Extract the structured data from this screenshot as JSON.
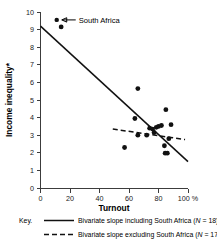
{
  "chart_data": {
    "type": "scatter",
    "title": "",
    "xlabel": "Turnout",
    "ylabel": "Income inequality*",
    "xlim": [
      0,
      100
    ],
    "ylim": [
      0,
      10
    ],
    "xticks": [
      0,
      20,
      40,
      60,
      80,
      100
    ],
    "xtick_labels": [
      "0",
      "20",
      "40",
      "60",
      "80",
      "100 %"
    ],
    "yticks": [
      0,
      1,
      2,
      3,
      4,
      5,
      6,
      7,
      8,
      9,
      10
    ],
    "ytick_labels": [
      "0",
      "1",
      "2",
      "3",
      "4",
      "5",
      "6",
      "7",
      "8",
      "9",
      "10"
    ],
    "grid": false,
    "x_unit_suffix": "%",
    "points": [
      {
        "x": 14.0,
        "y": 9.15,
        "label": "South Africa"
      },
      {
        "x": 66.0,
        "y": 5.65,
        "label": ""
      },
      {
        "x": 64.0,
        "y": 3.95,
        "label": ""
      },
      {
        "x": 66.0,
        "y": 3.0,
        "label": ""
      },
      {
        "x": 57.0,
        "y": 2.3,
        "label": ""
      },
      {
        "x": 72.0,
        "y": 3.0,
        "label": ""
      },
      {
        "x": 74.0,
        "y": 3.4,
        "label": ""
      },
      {
        "x": 76.0,
        "y": 3.35,
        "label": ""
      },
      {
        "x": 77.0,
        "y": 3.15,
        "label": ""
      },
      {
        "x": 78.5,
        "y": 3.45,
        "label": ""
      },
      {
        "x": 80.0,
        "y": 3.5,
        "label": ""
      },
      {
        "x": 82.0,
        "y": 3.55,
        "label": ""
      },
      {
        "x": 85.0,
        "y": 4.45,
        "label": ""
      },
      {
        "x": 84.0,
        "y": 2.4,
        "label": ""
      },
      {
        "x": 84.5,
        "y": 1.98,
        "label": ""
      },
      {
        "x": 86.0,
        "y": 1.98,
        "label": ""
      },
      {
        "x": 88.5,
        "y": 3.6,
        "label": ""
      },
      {
        "x": 87.0,
        "y": 2.8,
        "label": ""
      }
    ],
    "series": [
      {
        "name": "Bivariate slope including South Africa",
        "type": "line",
        "style": "solid",
        "n": 18,
        "x": [
          0,
          100
        ],
        "y": [
          9.2,
          1.5
        ]
      },
      {
        "name": "Bivariate slope excluding South Africa",
        "type": "line",
        "style": "dashed",
        "n": 17,
        "x": [
          49,
          98
        ],
        "y": [
          3.35,
          2.75
        ]
      }
    ],
    "annotations": [
      {
        "text": "South Africa",
        "points_to": {
          "x": 14.0,
          "y": 9.15
        },
        "marker_x": 11.0,
        "marker_y": 9.55
      }
    ]
  },
  "axis": {
    "x_title": "Turnout",
    "y_title": "Income inequality*"
  },
  "legend": {
    "key_label": "Key.",
    "entries": [
      {
        "style": "solid",
        "text_before": "Bivariate slope including South Africa (",
        "n_symbol": "N",
        "text_after": " = 18)"
      },
      {
        "style": "dashed",
        "text_before": "Bivariate slope excluding South Africa (",
        "n_symbol": "N",
        "text_after": " = 17)"
      }
    ]
  },
  "colors": {
    "data_point": "#111111",
    "axis": "#3c3c3c",
    "line": "#111111",
    "background": "#ffffff",
    "text": "#1a1a1a"
  }
}
